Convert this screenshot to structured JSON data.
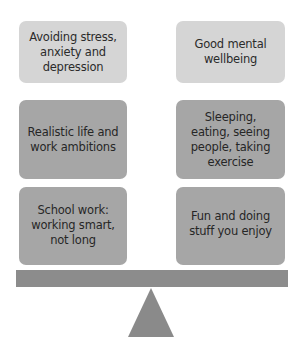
{
  "diagram": {
    "type": "balance-scale",
    "left_column": [
      {
        "label": "Avoiding stress,\nanxiety and\ndepression",
        "shade": "light"
      },
      {
        "label": "Realistic life and\nwork ambitions",
        "shade": "dark"
      },
      {
        "label": "School work:\nworking smart,\nnot long",
        "shade": "dark"
      }
    ],
    "right_column": [
      {
        "label": "Good mental\nwellbeing",
        "shade": "light"
      },
      {
        "label": "Sleeping,\neating, seeing\npeople, taking\nexercise",
        "shade": "dark"
      },
      {
        "label": "Fun and doing\nstuff you enjoy",
        "shade": "dark"
      }
    ],
    "colors": {
      "light_box": "#d5d5d5",
      "dark_box": "#a6a6a6",
      "beam": "#8c8c8c",
      "fulcrum": "#8a8a8a",
      "text": "#2b2b2b"
    }
  }
}
